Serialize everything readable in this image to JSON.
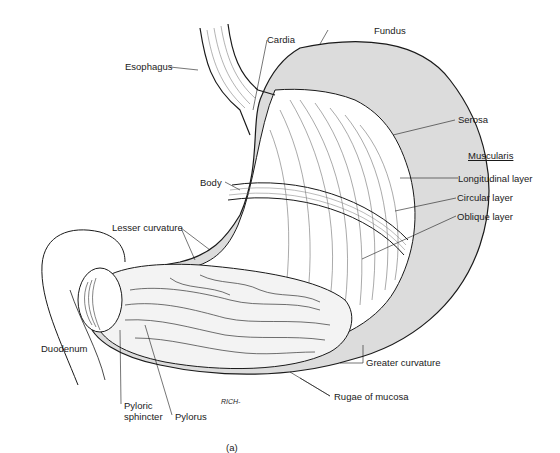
{
  "figure": {
    "caption": "(a)",
    "signature": "RICH-",
    "colors": {
      "background": "#ffffff",
      "ink": "#1a1a1a",
      "serosa_fill": "#d9d9d9",
      "muscle_fill": "#ffffff"
    }
  },
  "labels": {
    "esophagus": "Esophagus",
    "cardia": "Cardia",
    "fundus": "Fundus",
    "serosa": "Serosa",
    "muscularis": "Muscularis",
    "longitudinal_layer": "Longitudinal layer",
    "circular_layer": "Circular layer",
    "oblique_layer": "Oblique layer",
    "body": "Body",
    "lesser_curvature": "Lesser curvature",
    "duodenum": "Duodenum",
    "greater_curvature": "Greater curvature",
    "rugae_of_mucosa": "Rugae of mucosa",
    "pyloric_sphincter_line1": "Pyloric",
    "pyloric_sphincter_line2": "sphincter",
    "pylorus": "Pylorus"
  }
}
